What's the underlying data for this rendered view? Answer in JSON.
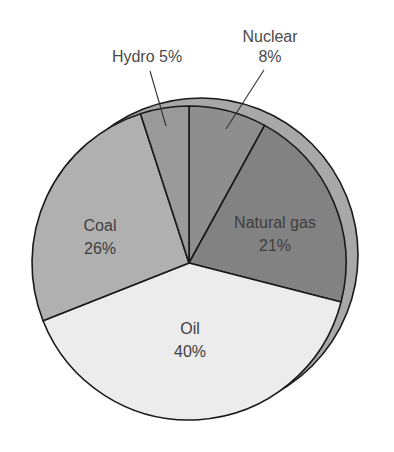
{
  "chart_data": {
    "type": "pie",
    "title": "",
    "style": "3d-offset-disc",
    "start_angle_deg": 0,
    "direction": "clockwise",
    "categories": [
      "Nuclear",
      "Natural gas",
      "Oil",
      "Coal",
      "Hydro"
    ],
    "values": [
      8,
      21,
      40,
      26,
      5
    ],
    "unit": "%",
    "slices": [
      {
        "name": "Nuclear",
        "value": 8,
        "label_line1": "Nuclear",
        "label_line2": "8%",
        "color": "#8e8e8e",
        "label_position": "outside",
        "label_x": 270,
        "label_y": 42,
        "label2_x": 270,
        "label2_y": 62,
        "leader": [
          [
            264,
            70
          ],
          [
            226,
            129
          ]
        ]
      },
      {
        "name": "Natural gas",
        "value": 21,
        "label_line1": "Natural gas",
        "label_line2": "21%",
        "color": "#828282",
        "label_position": "inside",
        "label_x": 275,
        "label_y": 228,
        "label2_x": 275,
        "label2_y": 251
      },
      {
        "name": "Oil",
        "value": 40,
        "label_line1": "Oil",
        "label_line2": "40%",
        "color": "#ececec",
        "label_position": "inside",
        "label_x": 190,
        "label_y": 334,
        "label2_x": 190,
        "label2_y": 357
      },
      {
        "name": "Coal",
        "value": 26,
        "label_line1": "Coal",
        "label_line2": "26%",
        "color": "#b0b0b0",
        "label_position": "inside",
        "label_x": 100,
        "label_y": 231,
        "label2_x": 100,
        "label2_y": 254
      },
      {
        "name": "Hydro",
        "value": 5,
        "label_line1": "Hydro 5%",
        "label_line2": "",
        "color": "#9a9a9a",
        "label_position": "outside",
        "label_x": 147,
        "label_y": 62,
        "label2_x": 147,
        "label2_y": 62,
        "leader": [
          [
            150,
            71
          ],
          [
            166,
            126
          ]
        ]
      }
    ],
    "geometry": {
      "cx": 189,
      "cy": 263,
      "r": 157,
      "back_cx": 201,
      "back_cy": 255,
      "back_r": 157,
      "back_color": "#a8a8a8",
      "stroke": "#1a1a1a"
    },
    "legend": "none"
  }
}
